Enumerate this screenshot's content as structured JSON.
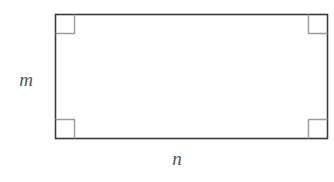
{
  "figure": {
    "kind": "geometry-diagram",
    "shape": "rectangle",
    "background_color": "#ffffff",
    "rectangle": {
      "stroke_color": "#3a3a3a",
      "fill_color": "#ffffff",
      "stroke_width": 1.6,
      "x": 55,
      "y": 14,
      "width": 273,
      "height": 125
    },
    "right_angle_markers": {
      "count": 4,
      "size": 19,
      "stroke_color": "#9a9a9a",
      "stroke_width": 1.4,
      "positions": [
        "top-left",
        "top-right",
        "bottom-left",
        "bottom-right"
      ]
    },
    "labels": {
      "left_side": {
        "text": "m",
        "meaning": "height-label",
        "color": "#555555",
        "style": "italic"
      },
      "bottom_side": {
        "text": "n",
        "meaning": "width-label",
        "color": "#555555",
        "style": "italic"
      }
    }
  }
}
